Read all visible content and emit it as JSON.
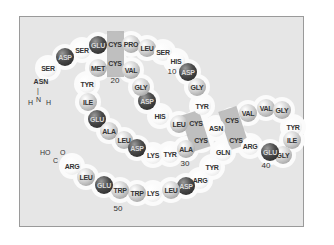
{
  "diagram": {
    "title": "",
    "n_terminus": {
      "label": "ASN",
      "group": "H‑N‑H",
      "H_left": "H",
      "N": "N",
      "H_right": "H"
    },
    "c_terminus": {
      "HO": "HO",
      "O": "O",
      "C": "C"
    },
    "residue_numbers": [
      {
        "label": "10",
        "x": 172,
        "y": 71
      },
      {
        "label": "20",
        "x": 115,
        "y": 80
      },
      {
        "label": "30",
        "x": 185,
        "y": 163
      },
      {
        "label": "40",
        "x": 266,
        "y": 165
      },
      {
        "label": "50",
        "x": 118,
        "y": 208
      }
    ],
    "residues": [
      {
        "name": "SER",
        "style": "white",
        "x": 48,
        "y": 68
      },
      {
        "name": "ASP",
        "style": "dark",
        "x": 65,
        "y": 57
      },
      {
        "name": "SER",
        "style": "white",
        "x": 82,
        "y": 50
      },
      {
        "name": "GLU",
        "style": "dark",
        "x": 98,
        "y": 45
      },
      {
        "name": "CYS",
        "style": "boxed",
        "x": 115,
        "y": 44
      },
      {
        "name": "PRO",
        "style": "light",
        "x": 131,
        "y": 44
      },
      {
        "name": "LEU",
        "style": "light",
        "x": 147,
        "y": 48
      },
      {
        "name": "SER",
        "style": "white",
        "x": 163,
        "y": 52
      },
      {
        "name": "HIS",
        "style": "white",
        "x": 176,
        "y": 61
      },
      {
        "name": "ASP",
        "style": "dark",
        "x": 188,
        "y": 72
      },
      {
        "name": "GLY",
        "style": "light",
        "x": 197,
        "y": 87
      },
      {
        "name": "TYR",
        "style": "white",
        "x": 202,
        "y": 106
      },
      {
        "name": "CYS",
        "style": "boxed",
        "x": 232,
        "y": 120
      },
      {
        "name": "VAL",
        "style": "light",
        "x": 248,
        "y": 113
      },
      {
        "name": "VAL",
        "style": "light",
        "x": 266,
        "y": 108
      },
      {
        "name": "GLY",
        "style": "light",
        "x": 282,
        "y": 110
      },
      {
        "name": "TYR",
        "style": "white",
        "x": 293,
        "y": 127
      },
      {
        "name": "ILE",
        "style": "light",
        "x": 292,
        "y": 140
      },
      {
        "name": "GLY",
        "style": "light",
        "x": 283,
        "y": 155
      },
      {
        "name": "GLU",
        "style": "dark",
        "x": 270,
        "y": 152
      },
      {
        "name": "ARG",
        "style": "white",
        "x": 250,
        "y": 146
      },
      {
        "name": "CYS",
        "style": "boxed",
        "x": 236,
        "y": 140
      },
      {
        "name": "ASN",
        "style": "white",
        "x": 216,
        "y": 128
      },
      {
        "name": "CYS",
        "style": "boxed",
        "x": 196,
        "y": 123
      },
      {
        "name": "LEU",
        "style": "light",
        "x": 179,
        "y": 124
      },
      {
        "name": "HIS",
        "style": "white",
        "x": 160,
        "y": 116
      },
      {
        "name": "ASP",
        "style": "dark",
        "x": 147,
        "y": 101
      },
      {
        "name": "GLY",
        "style": "light",
        "x": 141,
        "y": 87
      },
      {
        "name": "VAL",
        "style": "light",
        "x": 131,
        "y": 70
      },
      {
        "name": "CYS",
        "style": "boxed",
        "x": 115,
        "y": 63
      },
      {
        "name": "MET",
        "style": "light",
        "x": 98,
        "y": 68
      },
      {
        "name": "TYR",
        "style": "white",
        "x": 87,
        "y": 84
      },
      {
        "name": "ILE",
        "style": "light",
        "x": 88,
        "y": 102
      },
      {
        "name": "GLU",
        "style": "dark",
        "x": 97,
        "y": 119
      },
      {
        "name": "ALA",
        "style": "light",
        "x": 109,
        "y": 131
      },
      {
        "name": "LEU",
        "style": "light",
        "x": 124,
        "y": 140
      },
      {
        "name": "ASP",
        "style": "dark",
        "x": 137,
        "y": 148
      },
      {
        "name": "LYS",
        "style": "white",
        "x": 153,
        "y": 155
      },
      {
        "name": "TYR",
        "style": "white",
        "x": 170,
        "y": 154
      },
      {
        "name": "ALA",
        "style": "light",
        "x": 186,
        "y": 149
      },
      {
        "name": "CYS",
        "style": "boxed",
        "x": 201,
        "y": 140
      },
      {
        "name": "GLN",
        "style": "white",
        "x": 223,
        "y": 152
      },
      {
        "name": "TYR",
        "style": "white",
        "x": 212,
        "y": 167
      },
      {
        "name": "ARG",
        "style": "white",
        "x": 200,
        "y": 180
      },
      {
        "name": "ASP",
        "style": "dark",
        "x": 186,
        "y": 186
      },
      {
        "name": "LEU",
        "style": "light",
        "x": 171,
        "y": 190
      },
      {
        "name": "LYS",
        "style": "white",
        "x": 153,
        "y": 193
      },
      {
        "name": "TRP",
        "style": "light",
        "x": 137,
        "y": 193
      },
      {
        "name": "TRP",
        "style": "light",
        "x": 120,
        "y": 190
      },
      {
        "name": "GLU",
        "style": "dark",
        "x": 104,
        "y": 185
      },
      {
        "name": "LEU",
        "style": "light",
        "x": 86,
        "y": 177
      },
      {
        "name": "ARG",
        "style": "white",
        "x": 72,
        "y": 166
      }
    ],
    "disulfide_boxes": [
      {
        "x": 107,
        "y": 31,
        "w": 17,
        "h": 46,
        "rot": 0
      },
      {
        "x": 186,
        "y": 112,
        "w": 19,
        "h": 38,
        "rot": -18
      },
      {
        "x": 224,
        "y": 108,
        "w": 19,
        "h": 40,
        "rot": -18
      }
    ],
    "colors": {
      "background": "#e6e6e6",
      "border": "#9a9a9a",
      "dark_residue": "#333333",
      "light_residue": "#c8c8c8",
      "white_residue": "#f8f8f8",
      "disulfide_box": "#b4b4b4"
    }
  }
}
